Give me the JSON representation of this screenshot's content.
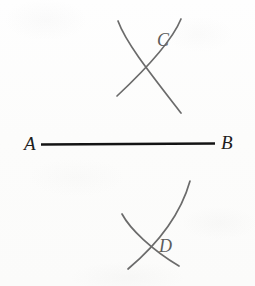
{
  "figure": {
    "background_color": "#fdfdfc",
    "width": 255,
    "height": 286,
    "segment": {
      "name": "segment-AB",
      "color": "#141414",
      "x1": 41,
      "y1": 144.5,
      "x2": 215,
      "y2": 143.5,
      "stroke_width": 2.6,
      "endpoint_labels": {
        "left": "A",
        "right": "B"
      }
    },
    "arc_color": "#6b6b6b",
    "arc_stroke_width": 1.7,
    "arcs": [
      {
        "name": "upper-left-arc",
        "path": "M 118 21 C 126 43, 150 73, 181 113",
        "description": "arc swung from A crossing above the segment"
      },
      {
        "name": "upper-right-arc",
        "path": "M 181 19 C 172 41, 147 68, 117 96",
        "description": "arc swung from B crossing above the segment"
      },
      {
        "name": "lower-left-arc",
        "path": "M 122 214 C 130 229, 152 250, 179 266",
        "description": "arc swung from A crossing below the segment"
      },
      {
        "name": "lower-right-arc",
        "path": "M 190 181 C 183 206, 166 237, 128 269",
        "description": "arc swung from B crossing below the segment"
      }
    ],
    "intersection_points": [
      {
        "name": "point-C",
        "label": "C",
        "x": 148,
        "y": 42,
        "position": "above segment"
      },
      {
        "name": "point-D",
        "label": "D",
        "x": 148,
        "y": 248,
        "position": "below segment"
      }
    ]
  }
}
